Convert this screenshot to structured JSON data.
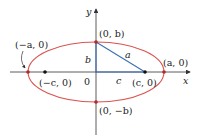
{
  "diagram": {
    "type": "ellipse-foci",
    "colors": {
      "ellipse": "#d9534f",
      "segments": "#3b6fb6",
      "axes": "#333333",
      "points": "#111111"
    },
    "axes": {
      "x_label": "x",
      "y_label": "y",
      "origin_label": "0"
    },
    "points": {
      "vertex_left": "(−a, 0)",
      "vertex_right": "(a, 0)",
      "covertex_top": "(0, b)",
      "covertex_bottom": "(0, −b)",
      "focus_left": "(−c, 0)",
      "focus_right": "(c, 0)"
    },
    "segment_labels": {
      "hypotenuse": "a",
      "vertical": "b",
      "horizontal": "c"
    }
  }
}
